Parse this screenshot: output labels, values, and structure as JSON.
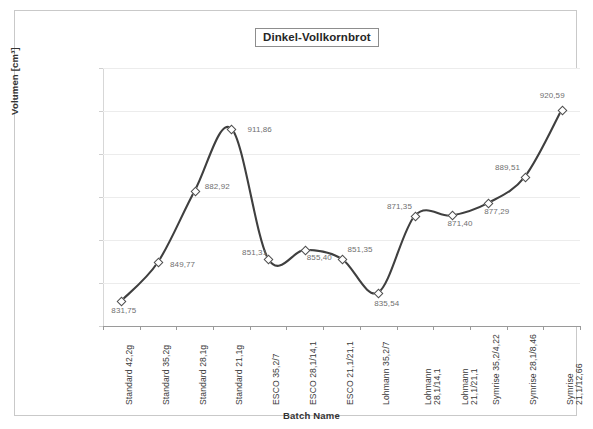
{
  "chart_data": {
    "type": "line",
    "title": "Dinkel-Vollkornbrot",
    "xlabel": "Batch Name",
    "ylabel": "Volumen [cm³]",
    "ylim": [
      820,
      940
    ],
    "ytick_step": 20,
    "grid": true,
    "legend": "none",
    "smoothed": true,
    "line_color": "#3f3f3f",
    "marker": "diamond-open",
    "ytick_labels": [
      "940,00",
      "920,00",
      "900,00",
      "880,00",
      "860,00",
      "840,00",
      "820,00"
    ],
    "ytick_values": [
      940,
      920,
      900,
      880,
      860,
      840,
      820
    ],
    "categories": [
      "Standard 42,2g",
      "Standard 35,2g",
      "Standard 28,1g",
      "Standard 21,1g",
      "ESCO 35,2/7",
      "ESCO 28,1/14,1",
      "ESCO 21,1/21,1",
      "Lohmann 35,2/7",
      "Lohmann\n28,1/14,1",
      "Lohmann\n21,1/21,1",
      "Symrise 35,2/4,22",
      "Symrise 28,1/8,46",
      "Symrise 21,1/12,66"
    ],
    "values": [
      831.75,
      849.77,
      882.92,
      911.86,
      851.31,
      855.4,
      851.35,
      835.54,
      871.35,
      871.4,
      877.29,
      889.51,
      920.59
    ],
    "data_labels": [
      "831,75",
      "849,77",
      "882,92",
      "911,86",
      "851,31",
      "855,40",
      "851,35",
      "835,54",
      "871,35",
      "871,40",
      "877,29",
      "889,51",
      "920,59"
    ]
  }
}
